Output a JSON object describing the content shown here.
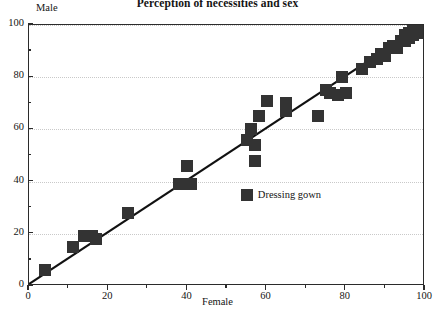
{
  "chart_data": {
    "type": "scatter",
    "title": "Perception of necessities and sex",
    "xlabel": "Female",
    "ylabel": "Male",
    "xlim": [
      0,
      100
    ],
    "ylim": [
      0,
      100
    ],
    "grid": true,
    "legend_position": "none",
    "xticks": [
      0,
      20,
      40,
      60,
      80,
      100
    ],
    "xticklabels": [
      "0",
      "20",
      "40",
      "60",
      "80",
      "100"
    ],
    "xminorticks": [
      10,
      30,
      50,
      70,
      90
    ],
    "yticks": [
      0,
      20,
      40,
      60,
      80,
      100
    ],
    "yticklabels": [
      "0",
      "20",
      "40",
      "60",
      "80",
      "100"
    ],
    "yminorticks": [
      10,
      30,
      50,
      70,
      90
    ],
    "marker": "filled-square",
    "marker_color": "#333333",
    "reference_line": {
      "label": "y = x",
      "from": [
        0,
        0
      ],
      "to": [
        100,
        100
      ],
      "color": "#111111"
    },
    "annotations": [
      {
        "label": "Dressing gown",
        "x": 55,
        "y": 35,
        "marker": "filled-square"
      }
    ],
    "points": [
      {
        "x": 4,
        "y": 6
      },
      {
        "x": 11,
        "y": 15
      },
      {
        "x": 14,
        "y": 19
      },
      {
        "x": 16,
        "y": 19
      },
      {
        "x": 17,
        "y": 18
      },
      {
        "x": 25,
        "y": 28
      },
      {
        "x": 38,
        "y": 39
      },
      {
        "x": 40,
        "y": 46
      },
      {
        "x": 41,
        "y": 39
      },
      {
        "x": 55,
        "y": 56
      },
      {
        "x": 56,
        "y": 60
      },
      {
        "x": 57,
        "y": 48
      },
      {
        "x": 57,
        "y": 54
      },
      {
        "x": 58,
        "y": 65
      },
      {
        "x": 60,
        "y": 71
      },
      {
        "x": 65,
        "y": 67
      },
      {
        "x": 65,
        "y": 70
      },
      {
        "x": 73,
        "y": 65
      },
      {
        "x": 75,
        "y": 75
      },
      {
        "x": 76,
        "y": 74
      },
      {
        "x": 78,
        "y": 73
      },
      {
        "x": 79,
        "y": 80
      },
      {
        "x": 80,
        "y": 74
      },
      {
        "x": 84,
        "y": 83
      },
      {
        "x": 86,
        "y": 86
      },
      {
        "x": 88,
        "y": 87
      },
      {
        "x": 89,
        "y": 89
      },
      {
        "x": 90,
        "y": 88
      },
      {
        "x": 91,
        "y": 91
      },
      {
        "x": 92,
        "y": 92
      },
      {
        "x": 93,
        "y": 91
      },
      {
        "x": 94,
        "y": 94
      },
      {
        "x": 95,
        "y": 94
      },
      {
        "x": 95,
        "y": 96
      },
      {
        "x": 96,
        "y": 95
      },
      {
        "x": 96,
        "y": 97
      },
      {
        "x": 97,
        "y": 96
      },
      {
        "x": 97,
        "y": 98
      },
      {
        "x": 98,
        "y": 97
      },
      {
        "x": 98,
        "y": 99
      },
      {
        "x": 99,
        "y": 98
      },
      {
        "x": 99,
        "y": 99
      },
      {
        "x": 100,
        "y": 99
      },
      {
        "x": 100,
        "y": 100
      }
    ]
  }
}
